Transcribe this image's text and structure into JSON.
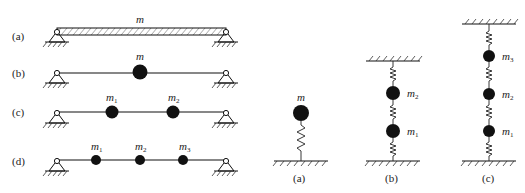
{
  "left_panel": {
    "rows": [
      {
        "label": "(a)",
        "type": "distributed-mass-beam",
        "mass_labels": [
          {
            "text": "m",
            "sub": ""
          }
        ]
      },
      {
        "label": "(b)",
        "type": "single-lumped-mass-beam",
        "mass_labels": [
          {
            "text": "m",
            "sub": ""
          }
        ]
      },
      {
        "label": "(c)",
        "type": "two-lumped-mass-beam",
        "mass_labels": [
          {
            "text": "m",
            "sub": "1"
          },
          {
            "text": "m",
            "sub": "2"
          }
        ]
      },
      {
        "label": "(d)",
        "type": "three-lumped-mass-beam",
        "mass_labels": [
          {
            "text": "m",
            "sub": "1"
          },
          {
            "text": "m",
            "sub": "2"
          },
          {
            "text": "m",
            "sub": "3"
          }
        ]
      }
    ]
  },
  "right_panel": {
    "systems": [
      {
        "label": "(a)",
        "type": "single-mass-spring",
        "mass_labels": [
          {
            "text": "m",
            "sub": ""
          }
        ]
      },
      {
        "label": "(b)",
        "type": "two-mass-spring-chain",
        "mass_labels": [
          {
            "text": "m",
            "sub": "2"
          },
          {
            "text": "m",
            "sub": "1"
          }
        ]
      },
      {
        "label": "(c)",
        "type": "three-mass-spring-chain",
        "mass_labels": [
          {
            "text": "m",
            "sub": "3"
          },
          {
            "text": "m",
            "sub": "2"
          },
          {
            "text": "m",
            "sub": "1"
          }
        ]
      }
    ]
  },
  "colors": {
    "ink": "#111111",
    "text": "#222222",
    "background": "#ffffff"
  }
}
